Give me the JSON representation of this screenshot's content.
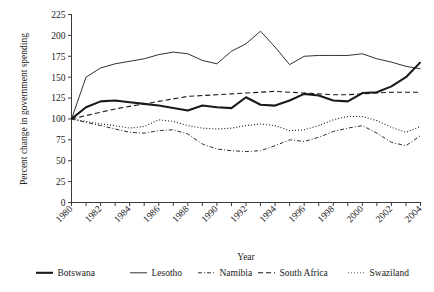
{
  "chart_data": {
    "type": "line",
    "title": "",
    "xlabel": "Year",
    "ylabel": "Percent change in government spending",
    "xlim": [
      1980,
      2004
    ],
    "ylim": [
      0,
      225
    ],
    "ytick_step": 25,
    "yticks": [
      0,
      25,
      50,
      75,
      100,
      125,
      150,
      175,
      200,
      225
    ],
    "ytick_labels": [
      "0",
      "25",
      "50",
      "75",
      "100",
      "125",
      "150",
      "175",
      "200",
      "225"
    ],
    "xticks": [
      1980,
      1981,
      1982,
      1983,
      1984,
      1985,
      1986,
      1987,
      1988,
      1989,
      1990,
      1991,
      1992,
      1993,
      1994,
      1995,
      1996,
      1997,
      1998,
      1999,
      2000,
      2001,
      2002,
      2003,
      2004
    ],
    "xtick_labels_shown": [
      "1980",
      "1982",
      "1984",
      "1986",
      "1988",
      "1990",
      "1992",
      "1994",
      "1996",
      "1998",
      "2000",
      "2002",
      "2004"
    ],
    "xtick_label_rotation": 45,
    "grid": false,
    "legend_position": "below",
    "x": [
      1980,
      1981,
      1982,
      1983,
      1984,
      1985,
      1986,
      1987,
      1988,
      1989,
      1990,
      1991,
      1992,
      1993,
      1994,
      1995,
      1996,
      1997,
      1998,
      1999,
      2000,
      2001,
      2002,
      2003,
      2004
    ],
    "series": [
      {
        "name": "Botswana",
        "style": "solid",
        "width": 2.1,
        "color": "#1a1a1a",
        "values": [
          100,
          114,
          121,
          122,
          120,
          118,
          116,
          113,
          110,
          116,
          114,
          113,
          126,
          117,
          116,
          122,
          130,
          128,
          122,
          121,
          131,
          132,
          139,
          150,
          168
        ]
      },
      {
        "name": "Lesotho",
        "style": "solid",
        "width": 0.9,
        "color": "#1a1a1a",
        "values": [
          100,
          150,
          161,
          166,
          169,
          172,
          177,
          180,
          178,
          170,
          166,
          181,
          190,
          205,
          186,
          165,
          175,
          176,
          176,
          176,
          178,
          172,
          168,
          163,
          160
        ]
      },
      {
        "name": "Namibia",
        "style": "dashdot",
        "width": 0.9,
        "color": "#1a1a1a",
        "values": [
          100,
          96,
          92,
          88,
          84,
          83,
          86,
          87,
          82,
          70,
          64,
          62,
          61,
          62,
          68,
          75,
          73,
          78,
          85,
          89,
          92,
          83,
          72,
          68,
          80
        ]
      },
      {
        "name": "South Africa",
        "style": "dashed",
        "width": 1.1,
        "color": "#1a1a1a",
        "values": [
          100,
          104,
          108,
          112,
          115,
          118,
          121,
          124,
          127,
          128,
          129,
          130,
          131,
          132,
          133,
          132,
          131,
          130,
          129,
          129,
          130,
          131,
          132,
          132,
          132
        ]
      },
      {
        "name": "Swaziland",
        "style": "dotted",
        "width": 1.1,
        "color": "#6a6a6a",
        "values": [
          100,
          97,
          94,
          92,
          89,
          91,
          99,
          97,
          92,
          89,
          88,
          89,
          92,
          94,
          92,
          86,
          87,
          92,
          99,
          103,
          103,
          98,
          90,
          84,
          91
        ]
      }
    ]
  },
  "legend": {
    "items": [
      {
        "label": "Botswana",
        "style": "solid",
        "width": 2.1,
        "color": "#1a1a1a"
      },
      {
        "label": "Lesotho",
        "style": "solid",
        "width": 0.9,
        "color": "#1a1a1a"
      },
      {
        "label": "Namibia",
        "style": "dashdot",
        "width": 0.9,
        "color": "#1a1a1a"
      },
      {
        "label": "South Africa",
        "style": "dashed",
        "width": 1.1,
        "color": "#1a1a1a"
      },
      {
        "label": "Swaziland",
        "style": "dotted",
        "width": 1.1,
        "color": "#6a6a6a"
      }
    ]
  }
}
